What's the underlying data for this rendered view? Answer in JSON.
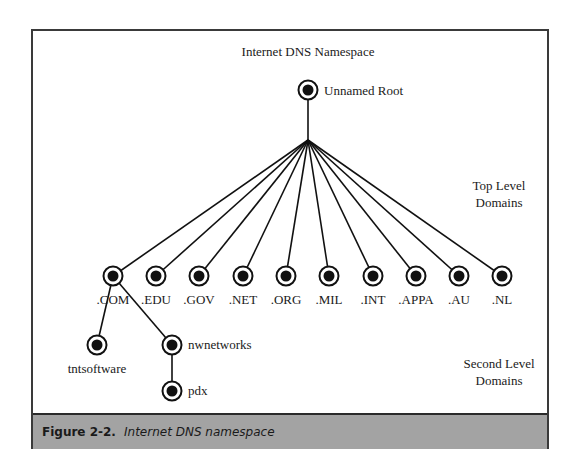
{
  "diagram": {
    "title": "Internet DNS Namespace",
    "root": {
      "label": "Unnamed Root",
      "x": 306,
      "y": 88
    },
    "fan_point": {
      "x": 306,
      "y": 138
    },
    "level_labels": {
      "top_level": [
        "Top Level",
        "Domains"
      ],
      "second_level": [
        "Second Level",
        "Domains"
      ]
    },
    "top_level_domains": [
      {
        "label": ".COM",
        "x": 111,
        "y": 274
      },
      {
        "label": ".EDU",
        "x": 154,
        "y": 274
      },
      {
        "label": ".GOV",
        "x": 197,
        "y": 274
      },
      {
        "label": ".NET",
        "x": 241,
        "y": 274
      },
      {
        "label": ".ORG",
        "x": 284,
        "y": 274
      },
      {
        "label": ".MIL",
        "x": 327,
        "y": 274
      },
      {
        "label": ".INT",
        "x": 371,
        "y": 274
      },
      {
        "label": ".APPA",
        "x": 414,
        "y": 274
      },
      {
        "label": ".AU",
        "x": 457,
        "y": 274
      },
      {
        "label": ".NL",
        "x": 500,
        "y": 274
      }
    ],
    "second_level_domains": [
      {
        "label": "tntsoftware",
        "parent": ".COM",
        "x": 95,
        "y": 343,
        "label_pos": "below"
      },
      {
        "label": "nwnetworks",
        "parent": ".COM",
        "x": 170,
        "y": 343,
        "label_pos": "right"
      }
    ],
    "third_level_domains": [
      {
        "label": "pdx",
        "parent": "nwnetworks",
        "x": 170,
        "y": 389,
        "label_pos": "right"
      }
    ]
  },
  "caption": {
    "figure_label": "Figure 2-2.",
    "text": "Internet DNS namespace"
  },
  "colors": {
    "line": "#111111",
    "node_fill": "#111111",
    "caption_bg": "#a3a3a3",
    "frame_border": "#3a3a3a"
  }
}
